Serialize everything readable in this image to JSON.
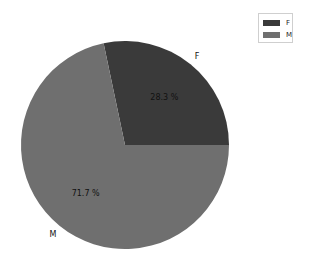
{
  "chart_data": {
    "type": "pie",
    "title": "",
    "categories": [
      "F",
      "M"
    ],
    "values": [
      28.3,
      71.7
    ],
    "value_labels": [
      "28.3 %",
      "71.7 %"
    ],
    "colors": [
      "#3a3a3a",
      "#6f6f6f"
    ],
    "start_angle_deg": 0,
    "direction": "counterclockwise",
    "legend": {
      "position": "upper right",
      "entries": [
        "F",
        "M"
      ]
    }
  },
  "legend": {
    "items": [
      {
        "label": "F",
        "color": "#3a3a3a"
      },
      {
        "label": "M",
        "color": "#6f6f6f"
      }
    ]
  }
}
